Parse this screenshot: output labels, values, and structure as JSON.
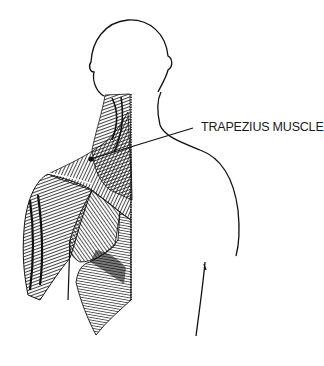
{
  "figure": {
    "callout": {
      "label": "TRAPEZIUS MUSCLE",
      "pointer_from": [
        91,
        159
      ],
      "pointer_to": [
        193,
        128
      ]
    },
    "colors": {
      "ink": "#111111",
      "label": "#1a1a1a",
      "background": "#ffffff"
    }
  }
}
